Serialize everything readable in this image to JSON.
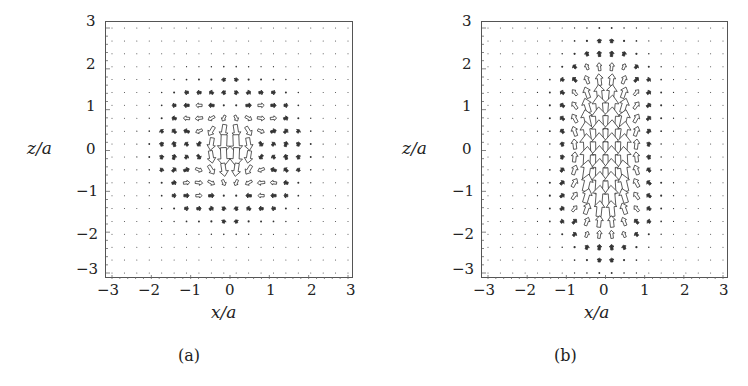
{
  "chart_data": [
    {
      "type": "quiver",
      "panel_label": "(a)",
      "xlabel": "x/a",
      "ylabel": "z/a",
      "xlim": [
        -3,
        3
      ],
      "ylim": [
        -3,
        3
      ],
      "xticks": [
        "−3",
        "−2",
        "−1",
        "0",
        "1",
        "2",
        "3"
      ],
      "yticks": [
        "3",
        "2",
        "1",
        "0",
        "−1",
        "−2",
        "−3"
      ],
      "grid_points": 20,
      "grid": false,
      "description": "Vector field: strong downward flow along central column near z=0, arrows spreading outward horizontally near z≈+0.7 (pointing away from axis) and converging near z≈-0.7; return flow upward at |z|≈1.5; magnitudes decay with distance from origin."
    },
    {
      "type": "quiver",
      "panel_label": "(b)",
      "xlabel": "x/a",
      "ylabel": "z/a",
      "xlim": [
        -3,
        3
      ],
      "ylim": [
        -3,
        3
      ],
      "xticks": [
        "−3",
        "−2",
        "−1",
        "0",
        "1",
        "2",
        "3"
      ],
      "yticks": [
        "3",
        "2",
        "1",
        "0",
        "−1",
        "−2",
        "−3"
      ],
      "grid_points": 20,
      "grid": false,
      "description": "Vector field: strong upward flow in a vertical band |x|<1 spanning z∈[-1.7,1.7]; above z≈0.3 side arrows diverge outward (upper-left/upper-right), below z≈-0.3 side arrows converge inward toward the axis; magnitudes decay away from the band."
    }
  ],
  "panels": {
    "a": {
      "caption": "(a)",
      "xlabel": "x/a",
      "ylabel": "z/a",
      "xticks": [
        "−3",
        "−2",
        "−1",
        "0",
        "1",
        "2",
        "3"
      ],
      "yticks": [
        "3",
        "2",
        "1",
        "0",
        "−1",
        "−2",
        "−3"
      ]
    },
    "b": {
      "caption": "(b)",
      "xlabel": "x/a",
      "ylabel": "z/a",
      "xticks": [
        "−3",
        "−2",
        "−1",
        "0",
        "1",
        "2",
        "3"
      ],
      "yticks": [
        "3",
        "2",
        "1",
        "0",
        "−1",
        "−2",
        "−3"
      ]
    }
  },
  "colors": {
    "arrow_stroke": "#333333",
    "arrow_fill": "#ffffff",
    "frame": "#555555"
  }
}
